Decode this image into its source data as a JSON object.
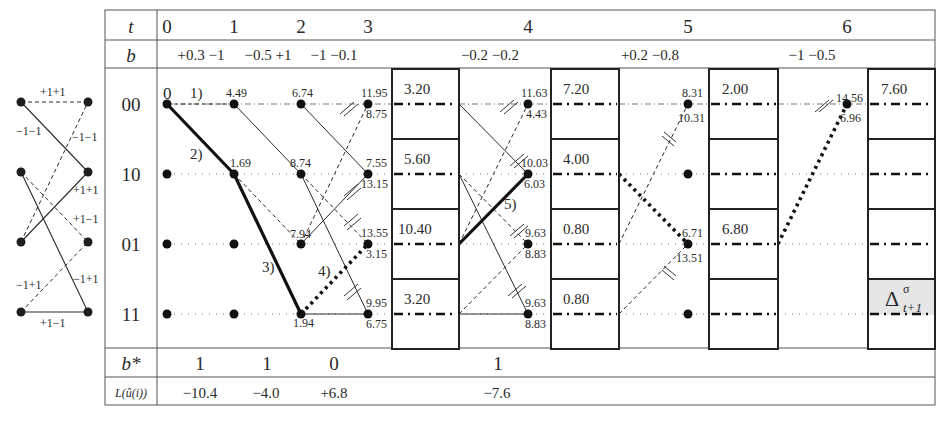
{
  "legend_trellis": {
    "labels": {
      "s00_s00": "+1+1",
      "s00_s10": "−1−1",
      "s10_s00": "−1−1",
      "s10_s01": "+1−1",
      "s01_s10": "+1+1",
      "s11_s01": "−1+1",
      "s11_s11_mid": "−1+1",
      "s11_s11": "+1−1"
    }
  },
  "table": {
    "row_headers": {
      "t": "t",
      "b": "b",
      "states": [
        "00",
        "10",
        "01",
        "11"
      ],
      "b_star": "b*",
      "llr": "L(û(i))"
    },
    "time_labels": [
      "0",
      "1",
      "2",
      "3",
      "4",
      "5",
      "6"
    ],
    "b_values": {
      "t01": "+0.3 −1",
      "t12": "−0.5 +1",
      "t23": "−1 −0.1",
      "t34": "−0.2 −0.2",
      "t45": "+0.2 −0.8",
      "t56": "−1 −0.5"
    },
    "b_star": [
      "1",
      "1",
      "0",
      "1"
    ],
    "llr_values": [
      "−10.4",
      "−4.0",
      "+6.8",
      "−7.6"
    ]
  },
  "trellis": {
    "step_markers": [
      "1)",
      "2)",
      "3)",
      "4)",
      "5)"
    ],
    "t0": {
      "s00": "0"
    },
    "t1": {
      "s00": "4.49",
      "s10": "1.69"
    },
    "t2": {
      "s00": "6.74",
      "s10": "8.74",
      "s01": "7.94",
      "s11": "1.94"
    },
    "t3": {
      "s00_top": "11.95",
      "s00_bot": "8.75",
      "s10_top": "7.55",
      "s10_bot": "13.15",
      "s01_top": "13.55",
      "s01_bot": "3.15",
      "s11_top": "9.95",
      "s11_bot": "6.75"
    },
    "t4": {
      "s00_top": "11.63",
      "s00_bot": "4.43",
      "s10_top": "10.03",
      "s10_bot": "6.03",
      "s01_top": "9.63",
      "s01_bot": "8.83",
      "s11_top": "9.63",
      "s11_bot": "8.83"
    },
    "t5": {
      "s00_top": "8.31",
      "s00_bot": "10.31",
      "s01_top": "6.71",
      "s01_bot": "13.51"
    },
    "t6": {
      "s00_top": "14.56",
      "s00_bot": "6.96"
    }
  },
  "delta_boxes": [
    {
      "values": [
        "3.20",
        "5.60",
        "10.40",
        "3.20"
      ]
    },
    {
      "values": [
        "7.20",
        "4.00",
        "0.80",
        "0.80"
      ]
    },
    {
      "values": [
        "2.00",
        "",
        "6.80",
        ""
      ]
    },
    {
      "values": [
        "7.60",
        "",
        "",
        ""
      ],
      "highlight_label": "Δ",
      "highlight_sup": "σ",
      "highlight_sub": "t+1"
    }
  ],
  "colors": {
    "line": "#2a2a2a",
    "grid": "#555555",
    "highlight_fill": "#e6e6e6"
  }
}
